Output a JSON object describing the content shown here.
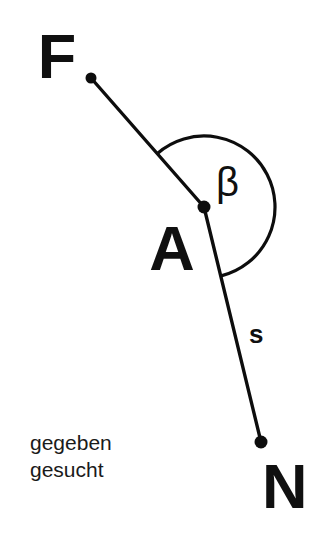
{
  "figure": {
    "background_color": "#ffffff",
    "ink_color": "#0d0d0d",
    "width": 325,
    "height": 539,
    "points": [
      {
        "id": "F",
        "label": "F",
        "x": 91,
        "y": 78,
        "label_x": 57,
        "label_y": 78,
        "dot_radius": 5.5
      },
      {
        "id": "A",
        "label": "A",
        "x": 204,
        "y": 207,
        "label_x": 172,
        "label_y": 270,
        "dot_radius": 6.5
      },
      {
        "id": "N",
        "label": "N",
        "x": 261,
        "y": 442,
        "label_x": 262,
        "label_y": 508,
        "dot_radius": 6.5
      }
    ],
    "segments": [
      {
        "id": "AF",
        "from": "F",
        "to": "A",
        "label": "",
        "x1": 91,
        "y1": 78,
        "x2": 204,
        "y2": 207
      },
      {
        "id": "AN",
        "from": "A",
        "to": "N",
        "label": "s",
        "x1": 204,
        "y1": 207,
        "x2": 261,
        "y2": 442,
        "label_x": 249,
        "label_y": 343
      }
    ],
    "angle": {
      "id": "beta",
      "label": "β",
      "vertex": "A",
      "center_x": 204,
      "center_y": 207,
      "radius": 71,
      "start_angle_deg": -131,
      "end_angle_deg": 76,
      "sweep": "clockwise",
      "label_x": 216,
      "label_y": 196
    },
    "notes": [
      {
        "id": "gegeben",
        "text": "gegeben",
        "x": 30,
        "y": 450
      },
      {
        "id": "gesucht",
        "text": "gesucht",
        "x": 30,
        "y": 477
      }
    ]
  }
}
